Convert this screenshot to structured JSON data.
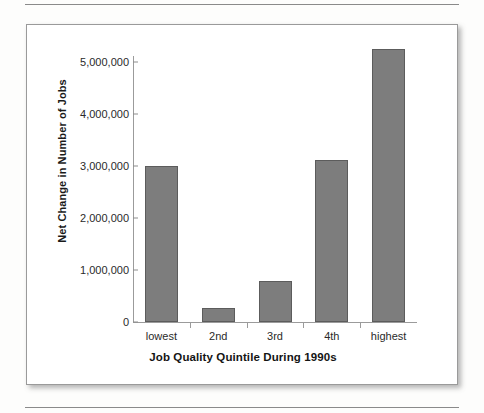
{
  "figure": {
    "background_color": "#ffffff",
    "border_color": "#9a9a9a",
    "rule_color": "#8a8a8a"
  },
  "chart_data": {
    "type": "bar",
    "title": "",
    "subtitle": "",
    "xlabel": "Job Quality Quintile During 1990s",
    "ylabel": "Net Change in Number of Jobs",
    "categories": [
      "lowest",
      "2nd",
      "3rd",
      "4th",
      "highest"
    ],
    "values": [
      3000000,
      270000,
      780000,
      3120000,
      5250000
    ],
    "series": [
      {
        "name": "Net Change in Number of Jobs",
        "values": [
          3000000,
          270000,
          780000,
          3120000,
          5250000
        ]
      }
    ],
    "ylim": [
      0,
      5400000
    ],
    "yticks": [
      0,
      1000000,
      2000000,
      3000000,
      4000000,
      5000000
    ],
    "ytick_labels": [
      "0",
      "1,000,000",
      "2,000,000",
      "3,000,000",
      "4,000,000",
      "5,000,000"
    ],
    "grid": false,
    "legend": false,
    "legend_position": "none",
    "bar_color": "#7d7d7d",
    "bar_edge_color": "#5c5c5c",
    "axis_color": "#9b9b9b"
  }
}
